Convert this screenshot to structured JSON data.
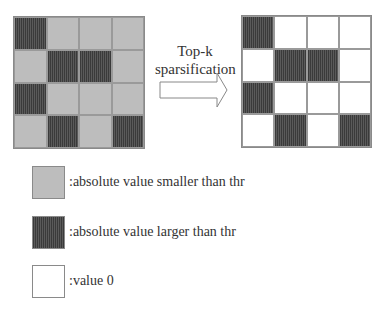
{
  "arrow": {
    "label_line1": "Top-k",
    "label_line2": "sparsification"
  },
  "left_matrix": {
    "cells": [
      [
        "large",
        "small",
        "small",
        "small"
      ],
      [
        "small",
        "large",
        "large",
        "small"
      ],
      [
        "large",
        "small",
        "small",
        "small"
      ],
      [
        "small",
        "large",
        "small",
        "large"
      ]
    ]
  },
  "right_matrix": {
    "cells": [
      [
        "large",
        "zero",
        "zero",
        "zero"
      ],
      [
        "zero",
        "large",
        "large",
        "zero"
      ],
      [
        "large",
        "zero",
        "zero",
        "zero"
      ],
      [
        "zero",
        "large",
        "zero",
        "large"
      ]
    ]
  },
  "legend": {
    "items": [
      {
        "type": "small",
        "label": ":absolute value smaller than thr"
      },
      {
        "type": "large",
        "label": ":absolute value larger than thr"
      },
      {
        "type": "zero",
        "label": ":value 0"
      }
    ]
  },
  "colors": {
    "large_fill": "#4a4a4a",
    "small_fill": "#e2e2e2",
    "zero_fill": "#ffffff",
    "border": "#8a8a8a"
  }
}
